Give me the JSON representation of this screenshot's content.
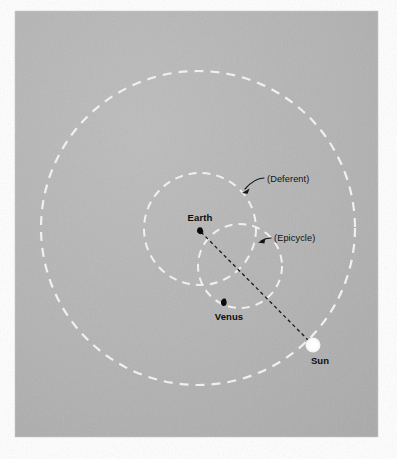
{
  "figure": {
    "panel": {
      "x": 15,
      "y": 11,
      "width": 363,
      "height": 426,
      "background_color": "#b4b4b4",
      "outer_background_color": "#ffffff"
    },
    "colors": {
      "orbit_stroke": "#f2f2f2",
      "body_dark": "#0a0a0a",
      "sun_fill": "#fdfdfd",
      "sight_line": "#1a1a1a",
      "label_text": "#0c0c0c"
    }
  },
  "bodies": [
    {
      "name": "Earth",
      "label": "Earth",
      "marker": "black-teardrop",
      "cx": 200,
      "cy": 231,
      "label_x": 200,
      "label_y": 221,
      "label_anchor": "middle"
    },
    {
      "name": "Venus",
      "label": "Venus",
      "marker": "black-teardrop",
      "cx": 224,
      "cy": 303,
      "label_x": 229,
      "label_y": 320,
      "label_anchor": "middle"
    },
    {
      "name": "Sun",
      "label": "Sun",
      "marker": "white-disc",
      "cx": 313,
      "cy": 345,
      "radius": 7.5,
      "label_x": 320,
      "label_y": 364,
      "label_anchor": "middle"
    }
  ],
  "orbits": [
    {
      "name": "sun-orbit",
      "cx": 198,
      "cy": 228,
      "r": 157,
      "style": "dashed",
      "stroke": "#f2f2f2",
      "stroke_width": 2.2,
      "dash": "9 7"
    },
    {
      "name": "deferent",
      "cx": 200,
      "cy": 229,
      "r": 56,
      "style": "dashed",
      "stroke": "#f2f2f2",
      "stroke_width": 2.0,
      "dash": "8 6"
    },
    {
      "name": "epicycle",
      "cx": 240,
      "cy": 266,
      "r": 42,
      "style": "dashed",
      "stroke": "#f2f2f2",
      "stroke_width": 2.0,
      "dash": "8 6"
    }
  ],
  "sight_line": {
    "name": "earth-sun-line",
    "from_x": 201,
    "from_y": 232,
    "to_x": 309,
    "to_y": 341,
    "stroke": "#1a1a1a",
    "stroke_width": 1.3,
    "dash": "3.5 3"
  },
  "annotations": [
    {
      "name": "deferent-annotation",
      "label": "(Deferent)",
      "text_x": 267,
      "text_y": 182,
      "text_anchor": "start",
      "leader_path": "M 264 178 C 258 178 252 181 245 189",
      "arrow_tip_x": 242,
      "arrow_tip_y": 193,
      "arrow_angle_deg": 131
    },
    {
      "name": "epicycle-annotation",
      "label": "(Epicycle)",
      "text_x": 274,
      "text_y": 241,
      "text_anchor": "start",
      "leader_path": "M 271 238 C 267 238 264 239 261 241",
      "arrow_tip_x": 258,
      "arrow_tip_y": 242,
      "arrow_angle_deg": 190
    }
  ]
}
